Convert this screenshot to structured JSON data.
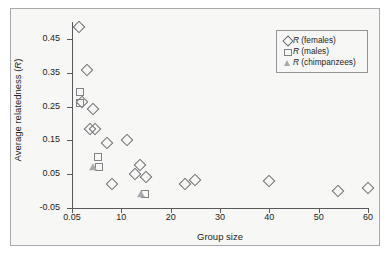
{
  "chart_data": {
    "type": "scatter",
    "title": "",
    "xlabel": "Group size",
    "ylabel": "Average relatedness (R)",
    "xlim": [
      0,
      60
    ],
    "ylim": [
      -0.05,
      0.5
    ],
    "grid": false,
    "legend_position": "top-right",
    "xticks": [
      "0.05",
      "10",
      "20",
      "30",
      "40",
      "50",
      "60"
    ],
    "xtick_values": [
      0,
      10,
      20,
      30,
      40,
      50,
      60
    ],
    "yticks": [
      "0.45",
      "0.35",
      "0.25",
      "0.15",
      "0.05",
      "-0.05"
    ],
    "ytick_values": [
      0.45,
      0.35,
      0.25,
      0.15,
      0.05,
      -0.05
    ],
    "series": [
      {
        "name": "R (females)",
        "marker": "diamond",
        "color": "#6d6e71",
        "points": [
          [
            1.5,
            0.485
          ],
          [
            3.0,
            0.357
          ],
          [
            2.0,
            0.262
          ],
          [
            4.2,
            0.242
          ],
          [
            3.7,
            0.184
          ],
          [
            4.6,
            0.184
          ],
          [
            7.0,
            0.142
          ],
          [
            11.2,
            0.152
          ],
          [
            13.8,
            0.077
          ],
          [
            12.8,
            0.051
          ],
          [
            15.0,
            0.042
          ],
          [
            8.2,
            0.022
          ],
          [
            23.0,
            0.022
          ],
          [
            25.0,
            0.032
          ],
          [
            40.0,
            0.031
          ],
          [
            54.0,
            0.0
          ],
          [
            60.0,
            0.01
          ]
        ]
      },
      {
        "name": "R (males)",
        "marker": "square",
        "color": "#808285",
        "points": [
          [
            1.6,
            0.292
          ],
          [
            1.6,
            0.26
          ],
          [
            5.3,
            0.102
          ],
          [
            5.4,
            0.07
          ],
          [
            14.8,
            -0.008
          ]
        ]
      },
      {
        "name": "R (chimpanzees)",
        "marker": "triangle",
        "color": "#a7a9ac",
        "points": [
          [
            4.2,
            0.072
          ],
          [
            13.9,
            -0.008
          ]
        ]
      }
    ]
  },
  "legend": {
    "items": [
      {
        "label_prefix": "R",
        "label_suffix": " (females)",
        "marker": "diamond-marker-icon"
      },
      {
        "label_prefix": "R",
        "label_suffix": " (males)",
        "marker": "square-marker-icon"
      },
      {
        "label_prefix": "R",
        "label_suffix": " (chimpanzees)",
        "marker": "triangle-marker-icon"
      }
    ]
  },
  "axes": {
    "y_title_prefix": "Average relatedness (",
    "y_title_italic": "R",
    "y_title_suffix": ")",
    "x_title": "Group size"
  }
}
